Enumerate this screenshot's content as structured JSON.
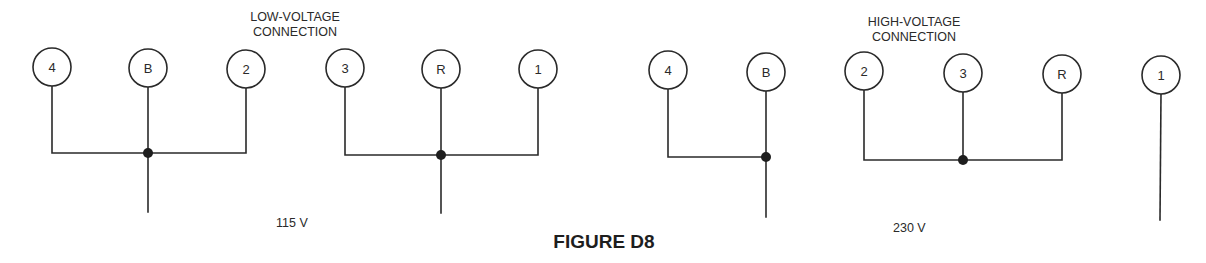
{
  "figure": {
    "title": "FIGURE D8",
    "colors": {
      "ink": "#2a2a2a",
      "background": "#ffffff"
    }
  },
  "low_voltage": {
    "heading_line1": "LOW-VOLTAGE",
    "heading_line2": "CONNECTION",
    "voltage_label": "115 V",
    "group_a": {
      "terminals": [
        {
          "label": "4",
          "cx": 52,
          "cy": 67
        },
        {
          "label": "B",
          "cx": 148,
          "cy": 68
        },
        {
          "label": "2",
          "cx": 246,
          "cy": 69
        }
      ],
      "bus_y": 153,
      "junction_x": 148,
      "lead_end_y": 212
    },
    "group_b": {
      "terminals": [
        {
          "label": "3",
          "cx": 345,
          "cy": 68
        },
        {
          "label": "R",
          "cx": 441,
          "cy": 69
        },
        {
          "label": "1",
          "cx": 538,
          "cy": 69
        }
      ],
      "bus_y": 155,
      "junction_x": 441,
      "lead_end_y": 213
    }
  },
  "high_voltage": {
    "heading_line1": "HIGH-VOLTAGE",
    "heading_line2": "CONNECTION",
    "voltage_label": "230 V",
    "group_a": {
      "terminals": [
        {
          "label": "4",
          "cx": 668,
          "cy": 70
        },
        {
          "label": "B",
          "cx": 766,
          "cy": 72
        }
      ],
      "bus_y": 157,
      "junction_x": 766,
      "lead_end_y": 217
    },
    "group_b": {
      "terminals": [
        {
          "label": "2",
          "cx": 864,
          "cy": 71
        },
        {
          "label": "3",
          "cx": 963,
          "cy": 73
        },
        {
          "label": "R",
          "cx": 1062,
          "cy": 74
        }
      ],
      "bus_y": 160,
      "junction_x": 963
    },
    "group_c": {
      "terminals": [
        {
          "label": "1",
          "cx": 1161,
          "cy": 75
        }
      ],
      "lead_end_y": 220
    }
  }
}
